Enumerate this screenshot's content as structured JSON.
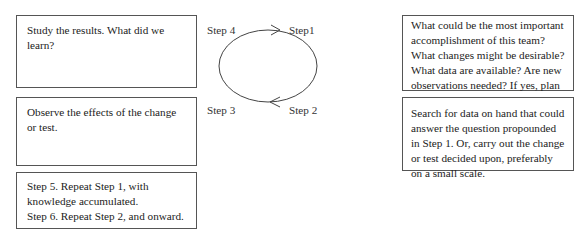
{
  "boxes": {
    "study": "Study the results. What did we learn?",
    "observe": "Observe the effects of the change or test.",
    "repeat": {
      "line1": "Step 5. Repeat Step 1, with knowledge accumulated.",
      "line2": "Step 6. Repeat Step 2, and onward."
    },
    "plan": "What could be the most important accomplishment of this team? What changes might be desirable? What data are available? Are new observations needed?  If yes, plan a change or test. Decide how you will use the observations.",
    "do": "Search for data on hand that could answer the question propounded in Step 1. Or, carry out the change or test decided upon, preferably on a small scale."
  },
  "cycle": {
    "labels": {
      "step1": "Step1",
      "step2": "Step 2",
      "step3": "Step 3",
      "step4": "Step 4"
    },
    "direction": "clockwise",
    "stroke_color": "#444444"
  }
}
